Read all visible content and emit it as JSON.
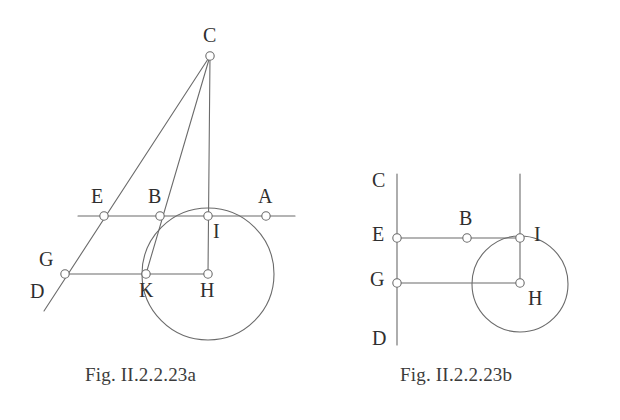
{
  "figures": [
    {
      "id": "fig-a",
      "caption": "Fig. II.2.2.23a",
      "caption_pos": {
        "x": 85,
        "y": 364
      },
      "stroke_color": "#6b6b6b",
      "label_color": "#2f2f2f",
      "circle": {
        "cx": 208,
        "cy": 274,
        "r": 66
      },
      "lines": [
        {
          "name": "line-AE-horizontal",
          "x1": 78,
          "y1": 216,
          "x2": 295,
          "y2": 216
        },
        {
          "name": "line-GH-horizontal",
          "x1": 65,
          "y1": 274,
          "x2": 208,
          "y2": 274
        },
        {
          "name": "line-DC-oblique",
          "x1": 44,
          "y1": 311,
          "x2": 210,
          "y2": 56
        },
        {
          "name": "line-CK-oblique",
          "x1": 210,
          "y1": 56,
          "x2": 146,
          "y2": 274
        },
        {
          "name": "line-CH-vertical",
          "x1": 210,
          "y1": 56,
          "x2": 208,
          "y2": 274
        }
      ],
      "points": [
        {
          "name": "point-C",
          "label": "C",
          "x": 210,
          "y": 56,
          "lx": 203,
          "ly": 25
        },
        {
          "name": "point-E",
          "label": "E",
          "x": 104,
          "y": 216,
          "lx": 91,
          "ly": 186
        },
        {
          "name": "point-B",
          "label": "B",
          "x": 160,
          "y": 216,
          "lx": 148,
          "ly": 186
        },
        {
          "name": "point-I",
          "label": "I",
          "x": 208,
          "y": 216,
          "lx": 213,
          "ly": 221
        },
        {
          "name": "point-A",
          "label": "A",
          "x": 266,
          "y": 216,
          "lx": 258,
          "ly": 186
        },
        {
          "name": "point-G",
          "label": "G",
          "x": 65,
          "y": 274,
          "lx": 39,
          "ly": 249
        },
        {
          "name": "point-D",
          "label": "D",
          "x": null,
          "y": null,
          "lx": 30,
          "ly": 281
        },
        {
          "name": "point-K",
          "label": "K",
          "x": 146,
          "y": 274,
          "lx": 139,
          "ly": 280
        },
        {
          "name": "point-H",
          "label": "H",
          "x": 208,
          "y": 274,
          "lx": 200,
          "ly": 280
        }
      ]
    },
    {
      "id": "fig-b",
      "caption": "Fig. II.2.2.23b",
      "caption_pos": {
        "x": 400,
        "y": 364
      },
      "stroke_color": "#6b6b6b",
      "label_color": "#2f2f2f",
      "circle": {
        "cx": 520,
        "cy": 284,
        "r": 48
      },
      "lines": [
        {
          "name": "line-CD-vertical",
          "x1": 397,
          "y1": 174,
          "x2": 397,
          "y2": 345
        },
        {
          "name": "line-I-vertical",
          "x1": 520,
          "y1": 174,
          "x2": 520,
          "y2": 284
        },
        {
          "name": "line-EI-horizontal",
          "x1": 397,
          "y1": 238,
          "x2": 520,
          "y2": 238
        },
        {
          "name": "line-GH-horizontal",
          "x1": 397,
          "y1": 283,
          "x2": 520,
          "y2": 283
        }
      ],
      "points": [
        {
          "name": "point-C",
          "label": "C",
          "x": null,
          "y": null,
          "lx": 372,
          "ly": 170
        },
        {
          "name": "point-E",
          "label": "E",
          "x": 397,
          "y": 238,
          "lx": 372,
          "ly": 224
        },
        {
          "name": "point-B",
          "label": "B",
          "x": 467,
          "y": 238,
          "lx": 459,
          "ly": 208
        },
        {
          "name": "point-I",
          "label": "I",
          "x": 520,
          "y": 238,
          "lx": 534,
          "ly": 224
        },
        {
          "name": "point-G",
          "label": "G",
          "x": 397,
          "y": 283,
          "lx": 370,
          "ly": 269
        },
        {
          "name": "point-H",
          "label": "H",
          "x": 520,
          "y": 283,
          "lx": 528,
          "ly": 288
        },
        {
          "name": "point-D",
          "label": "D",
          "x": null,
          "y": null,
          "lx": 372,
          "ly": 328
        }
      ]
    }
  ],
  "style": {
    "marker_radius": 4.2,
    "marker_fill": "#ffffff",
    "stroke_width": 1.1,
    "background": "#ffffff"
  }
}
